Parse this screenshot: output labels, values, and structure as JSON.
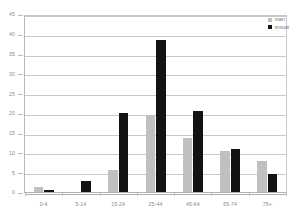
{
  "chart_data": {
    "type": "bar",
    "title": "",
    "subtitle": "",
    "xlabel": "",
    "ylabel": "",
    "categories": [
      "0-4",
      "5-14",
      "15-24",
      "25-44",
      "45-64",
      "65-74",
      "75+"
    ],
    "series": [
      {
        "name": "man",
        "color": "#c0c0c0",
        "values": [
          1.6,
          0,
          5.7,
          19.8,
          14.0,
          10.7,
          8.1
        ]
      },
      {
        "name": "vrouw",
        "color": "#131313",
        "values": [
          0.8,
          3.0,
          20.3,
          38.8,
          20.7,
          11.2,
          4.8
        ]
      }
    ],
    "ylim": [
      0,
      45
    ],
    "ytick_step": 5,
    "yticks": [
      0,
      5,
      10,
      15,
      20,
      25,
      30,
      35,
      40,
      45
    ],
    "ytick_labels": [
      "0",
      "5",
      "10",
      "15",
      "20",
      "25",
      "30",
      "35",
      "40",
      "45"
    ],
    "grid": true,
    "grid_axis": "y",
    "legend_position": "top-right",
    "background_color": "#ffffff",
    "grid_color": "#c9c9c9",
    "axis_color": "#b0b0b0",
    "tick_text_color": "#8a8a8a"
  },
  "legend": {
    "entries": [
      {
        "label": "man"
      },
      {
        "label": "vrouw"
      }
    ]
  }
}
